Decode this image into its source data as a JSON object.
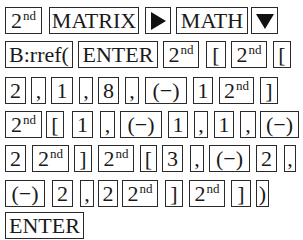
{
  "rows": [
    [
      {
        "label": "2",
        "sup": "nd",
        "x": 5,
        "w": 37
      },
      {
        "label": "MATRIX",
        "x": 49,
        "w": 90
      },
      {
        "icon": "right-triangle-icon",
        "label": "",
        "x": 145,
        "w": 26
      },
      {
        "label": "MATH",
        "x": 176,
        "w": 72
      },
      {
        "icon": "down-triangle-icon",
        "label": "",
        "x": 251,
        "w": 27
      }
    ],
    [
      {
        "label": "B:rref(",
        "x": 5,
        "w": 68
      },
      {
        "label": "ENTER",
        "x": 78,
        "w": 80
      },
      {
        "label": "2",
        "sup": "nd",
        "x": 163,
        "w": 36
      },
      {
        "label": "[",
        "x": 206,
        "w": 20
      },
      {
        "label": "2",
        "sup": "nd",
        "x": 231,
        "w": 36
      },
      {
        "label": "[",
        "x": 273,
        "w": 18
      }
    ],
    [
      {
        "label": "2",
        "x": 5,
        "w": 21
      },
      {
        "label": ",",
        "x": 31,
        "w": 15
      },
      {
        "label": "1",
        "x": 51,
        "w": 22
      },
      {
        "label": ",",
        "x": 79,
        "w": 14
      },
      {
        "label": "8",
        "x": 98,
        "w": 21
      },
      {
        "label": ",",
        "x": 125,
        "w": 14
      },
      {
        "label": "(−)",
        "x": 145,
        "w": 42
      },
      {
        "label": "1",
        "x": 193,
        "w": 20
      },
      {
        "label": "2",
        "sup": "nd",
        "x": 219,
        "w": 35
      },
      {
        "label": "]",
        "x": 260,
        "w": 18
      }
    ],
    [
      {
        "label": "2",
        "sup": "nd",
        "x": 5,
        "w": 37
      },
      {
        "label": "[",
        "x": 46,
        "w": 18
      },
      {
        "label": "1",
        "x": 72,
        "w": 21
      },
      {
        "label": ",",
        "x": 100,
        "w": 15
      },
      {
        "label": "(−)",
        "x": 120,
        "w": 42
      },
      {
        "label": "1",
        "x": 168,
        "w": 20
      },
      {
        "label": ",",
        "x": 194,
        "w": 14
      },
      {
        "label": "1",
        "x": 214,
        "w": 20
      },
      {
        "label": ",",
        "x": 240,
        "w": 16
      },
      {
        "label": "(−)",
        "x": 260,
        "w": 39
      }
    ],
    [
      {
        "label": "2",
        "x": 5,
        "w": 21
      },
      {
        "label": "2",
        "sup": "nd",
        "x": 32,
        "w": 37
      },
      {
        "label": "]",
        "x": 74,
        "w": 18
      },
      {
        "label": "2",
        "sup": "nd",
        "x": 98,
        "w": 36
      },
      {
        "label": "[",
        "x": 140,
        "w": 17
      },
      {
        "label": "3",
        "x": 162,
        "w": 21
      },
      {
        "label": ",",
        "x": 190,
        "w": 14
      },
      {
        "label": "(−)",
        "x": 209,
        "w": 41
      },
      {
        "label": "2",
        "x": 256,
        "w": 21
      },
      {
        "label": ",",
        "x": 284,
        "w": 12
      }
    ],
    [
      {
        "label": "(−)",
        "x": 5,
        "w": 40
      },
      {
        "label": "2",
        "x": 52,
        "w": 21
      },
      {
        "label": ",",
        "x": 80,
        "w": 14
      },
      {
        "label": "2",
        "x": 98,
        "w": 20
      },
      {
        "label": "2",
        "sup": "nd",
        "x": 122,
        "w": 36
      },
      {
        "label": "]",
        "x": 165,
        "w": 18
      },
      {
        "label": "2",
        "sup": "nd",
        "x": 189,
        "w": 36
      },
      {
        "label": "]",
        "x": 231,
        "w": 20
      },
      {
        "label": ")",
        "x": 256,
        "w": 13
      }
    ],
    [
      {
        "label": "ENTER",
        "x": 5,
        "w": 79
      }
    ]
  ],
  "row_tops": [
    7,
    41,
    77,
    111,
    145,
    180,
    212
  ],
  "row_height": 27
}
